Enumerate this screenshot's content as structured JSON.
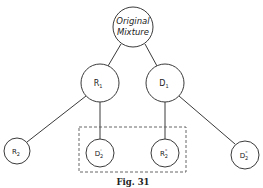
{
  "diagram": {
    "type": "tree",
    "root": {
      "id": "original",
      "label_line1": "Original",
      "label_line2": "Mixture"
    },
    "nodes": [
      {
        "id": "R1",
        "base": "R",
        "sub": "1",
        "sup": ""
      },
      {
        "id": "D1",
        "base": "D",
        "sub": "1",
        "sup": ""
      },
      {
        "id": "R2",
        "base": "R",
        "sub": "2",
        "sup": ""
      },
      {
        "id": "D2p",
        "base": "D",
        "sub": "2",
        "sup": "'"
      },
      {
        "id": "R2pp",
        "base": "R",
        "sub": "2",
        "sup": "\""
      },
      {
        "id": "D2pp",
        "base": "D",
        "sub": "2",
        "sup": "\""
      }
    ],
    "edges": [
      [
        "original",
        "R1"
      ],
      [
        "original",
        "D1"
      ],
      [
        "R1",
        "R2"
      ],
      [
        "R1",
        "D2p"
      ],
      [
        "D1",
        "R2pp"
      ],
      [
        "D1",
        "D2pp"
      ]
    ],
    "group": {
      "members": [
        "D2p",
        "R2pp"
      ],
      "style": "dashed"
    },
    "caption": "Fig. 31"
  }
}
